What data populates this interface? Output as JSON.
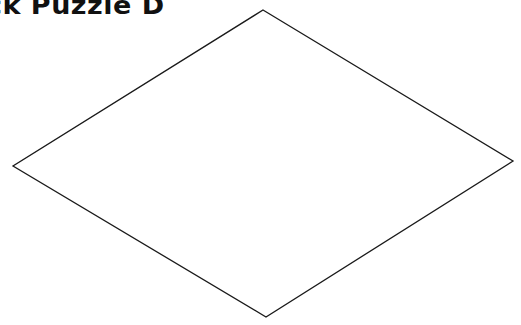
{
  "title": "ck Puzzle D",
  "diagram": {
    "shape": "rhombus",
    "stroke_color": "#1a1a1a",
    "fill_color": "#ffffff",
    "vertices": {
      "top": [
        263,
        10
      ],
      "right": [
        513,
        161
      ],
      "bottom": [
        266,
        317
      ],
      "left": [
        13,
        166
      ]
    }
  }
}
